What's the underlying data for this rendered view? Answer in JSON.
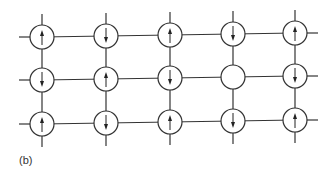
{
  "figure": {
    "panel_label": "(b)",
    "grid": {
      "rows": 3,
      "cols": 5,
      "col_x": [
        42,
        106,
        170,
        233,
        295
      ],
      "row_y_left": [
        37,
        80,
        124
      ],
      "row_y_right": [
        33,
        76,
        120
      ],
      "radius": 12,
      "stub_length": 11
    },
    "spins": [
      [
        "up",
        "down",
        "up",
        "down",
        "up"
      ],
      [
        "down",
        "up",
        "down",
        "empty",
        "down"
      ],
      [
        "up",
        "down",
        "up",
        "down",
        "up"
      ]
    ],
    "colors": {
      "line": "#333333",
      "arrow": "#222222",
      "background": "#ffffff"
    }
  }
}
